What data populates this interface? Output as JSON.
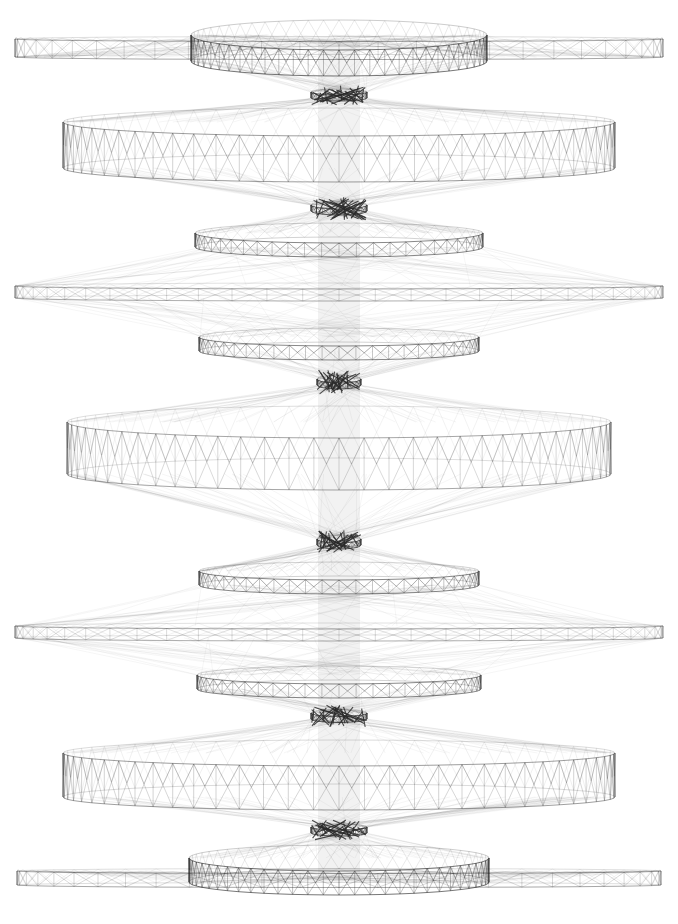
{
  "diagram": {
    "type": "network-graph",
    "background": "#ffffff",
    "edge_color": "#2a2a2a",
    "width": 678,
    "height": 924,
    "center_x": 339,
    "rings": [
      {
        "id": "ring-1-top-wide",
        "cy": 48,
        "rx": 324,
        "ry": 5,
        "band": 18,
        "flat": true,
        "density": 26,
        "weight": 0.55
      },
      {
        "id": "ring-1-top-core",
        "cy": 48,
        "rx": 148,
        "ry": 30,
        "band": 26,
        "flat": false,
        "density": 30,
        "weight": 0.85
      },
      {
        "id": "knot-1",
        "cy": 95,
        "rx": 28,
        "ry": 6,
        "band": 6,
        "flat": false,
        "density": 10,
        "weight": 1.0,
        "knot": true
      },
      {
        "id": "ring-2-band",
        "cy": 145,
        "rx": 276,
        "ry": 28,
        "band": 46,
        "flat": false,
        "density": 34,
        "weight": 0.6
      },
      {
        "id": "knot-2",
        "cy": 208,
        "rx": 28,
        "ry": 8,
        "band": 6,
        "flat": false,
        "density": 10,
        "weight": 1.0,
        "knot": true
      },
      {
        "id": "ring-3-core",
        "cy": 240,
        "rx": 144,
        "ry": 20,
        "band": 14,
        "flat": false,
        "density": 26,
        "weight": 0.75
      },
      {
        "id": "ring-4-wide",
        "cy": 292,
        "rx": 324,
        "ry": 6,
        "band": 12,
        "flat": true,
        "density": 28,
        "weight": 0.5
      },
      {
        "id": "ring-5-core",
        "cy": 344,
        "rx": 140,
        "ry": 18,
        "band": 14,
        "flat": false,
        "density": 26,
        "weight": 0.75
      },
      {
        "id": "knot-3",
        "cy": 382,
        "rx": 22,
        "ry": 8,
        "band": 6,
        "flat": false,
        "density": 10,
        "weight": 1.0,
        "knot": true
      },
      {
        "id": "ring-6-band",
        "cy": 448,
        "rx": 272,
        "ry": 32,
        "band": 52,
        "flat": false,
        "density": 34,
        "weight": 0.55
      },
      {
        "id": "knot-4",
        "cy": 542,
        "rx": 22,
        "ry": 8,
        "band": 6,
        "flat": false,
        "density": 10,
        "weight": 1.0,
        "knot": true
      },
      {
        "id": "ring-7-core",
        "cy": 578,
        "rx": 140,
        "ry": 18,
        "band": 14,
        "flat": false,
        "density": 26,
        "weight": 0.75
      },
      {
        "id": "ring-8-wide",
        "cy": 632,
        "rx": 324,
        "ry": 6,
        "band": 12,
        "flat": true,
        "density": 28,
        "weight": 0.5
      },
      {
        "id": "ring-9-core",
        "cy": 682,
        "rx": 142,
        "ry": 18,
        "band": 14,
        "flat": false,
        "density": 26,
        "weight": 0.75
      },
      {
        "id": "knot-5",
        "cy": 716,
        "rx": 28,
        "ry": 7,
        "band": 6,
        "flat": false,
        "density": 10,
        "weight": 1.0,
        "knot": true
      },
      {
        "id": "ring-10-band",
        "cy": 775,
        "rx": 276,
        "ry": 26,
        "band": 44,
        "flat": false,
        "density": 34,
        "weight": 0.6
      },
      {
        "id": "knot-6",
        "cy": 830,
        "rx": 28,
        "ry": 6,
        "band": 6,
        "flat": false,
        "density": 10,
        "weight": 1.0,
        "knot": true
      },
      {
        "id": "ring-11-bottom-core",
        "cy": 870,
        "rx": 150,
        "ry": 26,
        "band": 24,
        "flat": false,
        "density": 30,
        "weight": 0.85
      },
      {
        "id": "ring-11-bottom-wide",
        "cy": 878,
        "rx": 322,
        "ry": 5,
        "band": 14,
        "flat": true,
        "density": 26,
        "weight": 0.55
      }
    ],
    "central_column": {
      "x": 318,
      "width": 42,
      "top": 40,
      "bottom": 880,
      "opacity": 0.06
    }
  }
}
